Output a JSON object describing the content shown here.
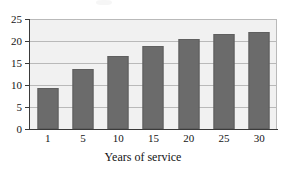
{
  "chart_data": {
    "type": "bar",
    "title": "",
    "xlabel": "Years of service",
    "ylabel": "",
    "categories": [
      "1",
      "5",
      "10",
      "15",
      "20",
      "25",
      "30"
    ],
    "values": [
      9.4,
      13.6,
      16.6,
      18.8,
      20.5,
      21.7,
      22.0
    ],
    "ylim": [
      0,
      25
    ],
    "yticks": [
      0,
      5,
      10,
      15,
      20,
      25
    ],
    "ytick_labels": [
      "0",
      "5",
      "10",
      "15",
      "20",
      "25"
    ],
    "grid": true,
    "grid_axis": "y",
    "legend": false,
    "legend_position": "none",
    "bar_color": "#6b6b6b",
    "plot_background": "#f1f1f1",
    "gridline_color": "#b9b9b9",
    "axis_color": "#3a3a3a",
    "page_background": "#ffffff"
  }
}
